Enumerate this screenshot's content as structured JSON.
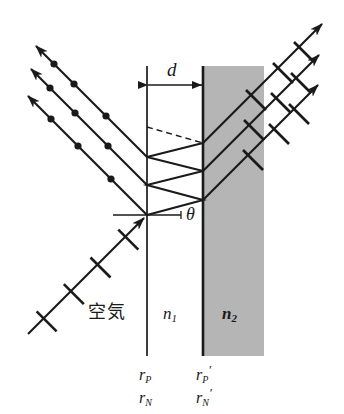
{
  "figure": {
    "type": "optics-ray-diagram",
    "background_color": "#ffffff",
    "ink_color": "#1a1a1a",
    "shade_color": "#b3b3b3"
  },
  "labels": {
    "thickness": "d",
    "angle": "θ",
    "air": "空気",
    "n1": "n",
    "n1_sub": "1",
    "n2": "n",
    "n2_sub": "2",
    "rP": "r",
    "rP_sub": "P",
    "rN": "r",
    "rN_sub": "N",
    "rPprime": "r",
    "rPprime_sub": "P",
    "rPprime_prime": "′",
    "rNprime": "r",
    "rNprime_sub": "N",
    "rNprime_prime": "′"
  },
  "geometry": {
    "left_interface_x": 147,
    "right_interface_x": 203,
    "interface_top_y": 66,
    "interface_bottom_y": 356,
    "shade_left_x": 203,
    "shade_right_x": 264,
    "shade_top_y": 66,
    "shade_bottom_y": 356,
    "entry_point": {
      "x": 147,
      "y": 215
    },
    "theta_ref_line": {
      "x1": 113,
      "y1": 215,
      "x2": 180,
      "y2": 215
    },
    "zigzag_vertices": [
      {
        "x": 147,
        "y": 215
      },
      {
        "x": 203,
        "y": 200
      },
      {
        "x": 147,
        "y": 185
      },
      {
        "x": 203,
        "y": 171
      },
      {
        "x": 147,
        "y": 157
      },
      {
        "x": 203,
        "y": 143
      }
    ],
    "dashed_line": {
      "x1": 147,
      "y1": 127,
      "x2": 203,
      "y2": 143
    }
  },
  "rays": {
    "incident": {
      "name": "incident-ray",
      "marker": "tick",
      "direction": "up-right",
      "from": {
        "x": 28,
        "y": 334
      },
      "to": {
        "x": 147,
        "y": 215
      },
      "tick_positions": [
        0.12,
        0.35,
        0.58,
        0.82
      ]
    },
    "reflected": [
      {
        "name": "reflected-ray-1",
        "marker": "dot",
        "direction": "up-left",
        "from": {
          "x": 147,
          "y": 215
        },
        "to": {
          "x": 25,
          "y": 93
        },
        "dot_positions": [
          0.3,
          0.58,
          0.85
        ]
      },
      {
        "name": "reflected-ray-2",
        "marker": "dot",
        "direction": "up-left",
        "from": {
          "x": 147,
          "y": 185
        },
        "to": {
          "x": 28,
          "y": 66
        },
        "dot_positions": [
          0.34,
          0.64,
          0.9
        ]
      },
      {
        "name": "reflected-ray-3",
        "marker": "dot",
        "direction": "up-left",
        "from": {
          "x": 147,
          "y": 157
        },
        "to": {
          "x": 33,
          "y": 43
        },
        "dot_positions": [
          0.37,
          0.7,
          0.92
        ]
      }
    ],
    "transmitted": [
      {
        "name": "transmitted-ray-1",
        "marker": "tick",
        "direction": "up-right",
        "from": {
          "x": 203,
          "y": 200
        },
        "to": {
          "x": 321,
          "y": 82
        },
        "tick_positions": [
          0.43,
          0.66,
          0.88
        ]
      },
      {
        "name": "transmitted-ray-2",
        "marker": "tick",
        "direction": "up-right",
        "from": {
          "x": 203,
          "y": 171
        },
        "to": {
          "x": 322,
          "y": 52
        },
        "tick_positions": [
          0.44,
          0.68,
          0.9
        ]
      },
      {
        "name": "transmitted-ray-3",
        "marker": "tick",
        "direction": "up-right",
        "from": {
          "x": 203,
          "y": 143
        },
        "to": {
          "x": 325,
          "y": 21
        },
        "tick_positions": [
          0.45,
          0.7,
          0.92
        ]
      }
    ]
  },
  "dimension": {
    "name": "thickness-dimension",
    "y": 85,
    "x1": 147,
    "x2": 203
  }
}
